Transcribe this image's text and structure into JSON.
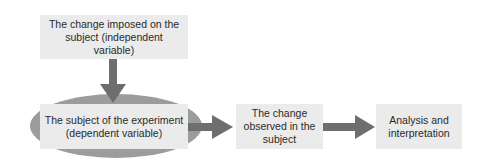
{
  "diagram": {
    "type": "flowchart",
    "nodes": [
      {
        "id": "independent",
        "label": "The change imposed on the subject (independent variable)"
      },
      {
        "id": "dependent",
        "label": "The subject of the experiment (dependent variable)"
      },
      {
        "id": "observed",
        "label": "The change observed in the subject"
      },
      {
        "id": "analysis",
        "label": "Analysis and interpretation"
      }
    ],
    "edges": [
      {
        "from": "independent",
        "to": "dependent"
      },
      {
        "from": "dependent",
        "to": "observed"
      },
      {
        "from": "observed",
        "to": "analysis"
      }
    ],
    "colors": {
      "box": "#ebebeb",
      "arrow": "#6e6e6e",
      "ellipse": "#9c9c9c",
      "text": "#2a2a2a"
    }
  }
}
